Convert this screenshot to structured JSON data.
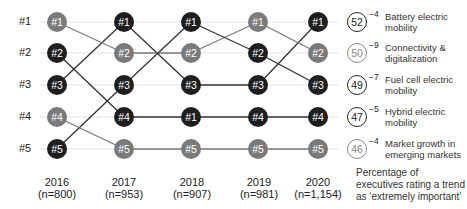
{
  "chart_data": {
    "type": "bump",
    "title": "",
    "rank_labels": [
      "#1",
      "#2",
      "#3",
      "#4",
      "#5"
    ],
    "years": [
      {
        "year": "2016",
        "n": "(n=800)"
      },
      {
        "year": "2017",
        "n": "(n=953)"
      },
      {
        "year": "2018",
        "n": "(n=907)"
      },
      {
        "year": "2019",
        "n": "(n=981)"
      },
      {
        "year": "2020",
        "n": "(n=1,154)"
      }
    ],
    "node_labels": [
      [
        "#1",
        "#2",
        "#3",
        "#4",
        "#5"
      ],
      [
        "#1",
        "#2",
        "#3",
        "#4",
        "#5"
      ],
      [
        "#1",
        "#2",
        "#3",
        "#1",
        "#5"
      ],
      [
        "#1",
        "#2",
        "#3",
        "#4",
        "#5"
      ],
      [
        "#1",
        "#2",
        "#3",
        "#4",
        "#5"
      ]
    ],
    "series": [
      {
        "name": "Battery electric mobility",
        "ranks": [
          3,
          1,
          3,
          3,
          1
        ]
      },
      {
        "name": "Connectivity & digitalization",
        "ranks": [
          1,
          2,
          2,
          1,
          2
        ]
      },
      {
        "name": "Fuel cell electric mobility",
        "ranks": [
          5,
          3,
          1,
          2,
          3
        ]
      },
      {
        "name": "Hybrid electric mobility",
        "ranks": [
          2,
          4,
          4,
          4,
          4
        ]
      },
      {
        "name": "Market growth in emerging markets",
        "ranks": [
          4,
          5,
          5,
          5,
          5
        ]
      }
    ],
    "node_colors": [
      [
        "#7a7a7a",
        "#1e1e1e",
        "#1e1e1e",
        "#7a7a7a",
        "#1e1e1e"
      ],
      [
        "#1e1e1e",
        "#7a7a7a",
        "#1e1e1e",
        "#1e1e1e",
        "#7a7a7a"
      ],
      [
        "#1e1e1e",
        "#7a7a7a",
        "#1e1e1e",
        "#1e1e1e",
        "#7a7a7a"
      ],
      [
        "#7a7a7a",
        "#1e1e1e",
        "#1e1e1e",
        "#1e1e1e",
        "#7a7a7a"
      ],
      [
        "#1e1e1e",
        "#7a7a7a",
        "#1e1e1e",
        "#1e1e1e",
        "#7a7a7a"
      ]
    ],
    "legend": [
      {
        "score": "52",
        "delta": "−4",
        "label": "Battery electric mobility",
        "style": "dark"
      },
      {
        "score": "50",
        "delta": "−9",
        "label": "Connectivity & digitalization",
        "style": "light"
      },
      {
        "score": "49",
        "delta": "−7",
        "label": "Fuel cell electric mobility",
        "style": "dark"
      },
      {
        "score": "47",
        "delta": "−5",
        "label": "Hybrid electric mobility",
        "style": "dark"
      },
      {
        "score": "46",
        "delta": "−4",
        "label": "Market growth in emerging markets",
        "style": "light"
      }
    ],
    "note": "Percentage of executives rating a trend as ‘extremely important’",
    "colors": {
      "dark": "#1e1e1e",
      "light": "#7a7a7a",
      "grid": "#e4e4e4"
    }
  }
}
